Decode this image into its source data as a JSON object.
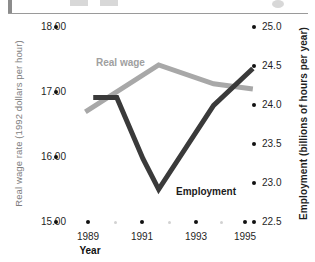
{
  "figure": {
    "background": "#ffffff",
    "width": 315,
    "height": 262
  },
  "header_strip": {
    "present": true,
    "rule_color": "#9a9a9a",
    "tab_color": "#8c8c8c"
  },
  "chart_data": {
    "type": "line",
    "title": "",
    "xlabel": "Year",
    "ylabel": "Real wage rate (1992 dollars per hour)",
    "y2label": "Employment (billions of hours per year)",
    "grid": false,
    "legend": "inline-annotations",
    "xlim": [
      1988.4,
      1995.8
    ],
    "ylim": [
      15.0,
      18.0
    ],
    "y2lim": [
      22.5,
      25.0
    ],
    "x_ticks": [
      "1989",
      "1991",
      "1993",
      "1995"
    ],
    "x_tick_values": [
      1989,
      1991,
      1993,
      1995
    ],
    "x_minor_values": [
      1990,
      1992,
      1994
    ],
    "y_ticks": [
      "18.00",
      "17.00",
      "16.00",
      "15.00"
    ],
    "y_tick_values": [
      18.0,
      17.0,
      16.0,
      15.0
    ],
    "y2_ticks": [
      "25.0",
      "24.5",
      "24.0",
      "23.5",
      "23.0",
      "22.5"
    ],
    "y2_tick_values": [
      25.0,
      24.5,
      24.0,
      23.5,
      23.0,
      22.5
    ],
    "series": [
      {
        "name": "Real wage",
        "axis": "left",
        "color": "#a8a8a8",
        "label_color": "#a0a0a0",
        "x": [
          1988.9,
          1991.7,
          1993.8,
          1995.3
        ],
        "values": [
          16.7,
          17.42,
          17.13,
          17.05
        ]
      },
      {
        "name": "Employment",
        "axis": "right",
        "color": "#3a3a3a",
        "label_color": "#1b1b1b",
        "x": [
          1989.2,
          1990.1,
          1991.1,
          1991.7,
          1993.8,
          1995.3
        ],
        "values": [
          24.1,
          24.1,
          23.32,
          22.93,
          24.0,
          24.47
        ]
      }
    ],
    "annotations": [
      {
        "text": "Real wage",
        "series": "Real wage"
      },
      {
        "text": "Employment",
        "series": "Employment"
      }
    ]
  }
}
